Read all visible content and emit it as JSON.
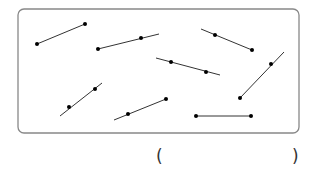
{
  "diagram": {
    "type": "line-segments-rays-lines",
    "frame": {
      "x": 18,
      "y": 9,
      "width": 281,
      "height": 124,
      "radius": 6,
      "stroke": "#888888"
    },
    "line_color": "#333333",
    "point_color": "#000000",
    "figures": [
      {
        "id": 1,
        "kind": "segment",
        "from": [
          37,
          44
        ],
        "to": [
          85,
          24
        ],
        "points": [
          [
            37,
            44
          ],
          [
            85,
            24
          ]
        ]
      },
      {
        "id": 2,
        "kind": "ray",
        "from": [
          98,
          49
        ],
        "to": [
          159,
          34
        ],
        "points": [
          [
            98,
            49
          ],
          [
            141,
            38
          ]
        ]
      },
      {
        "id": 3,
        "kind": "ray",
        "from": [
          201,
          29
        ],
        "to": [
          252,
          50
        ],
        "points": [
          [
            215,
            35
          ],
          [
            252,
            50
          ]
        ]
      },
      {
        "id": 4,
        "kind": "line",
        "from": [
          156,
          58
        ],
        "to": [
          220,
          75
        ],
        "points": [
          [
            171,
            62
          ],
          [
            206,
            72
          ]
        ]
      },
      {
        "id": 5,
        "kind": "ray",
        "from": [
          240,
          98
        ],
        "to": [
          284,
          52
        ],
        "points": [
          [
            240,
            98
          ],
          [
            271,
            64
          ]
        ]
      },
      {
        "id": 6,
        "kind": "line",
        "from": [
          60,
          116
        ],
        "to": [
          102,
          83
        ],
        "points": [
          [
            69,
            107
          ],
          [
            95,
            89
          ]
        ]
      },
      {
        "id": 7,
        "kind": "ray",
        "from": [
          114,
          120
        ],
        "to": [
          166,
          99
        ],
        "points": [
          [
            128,
            114
          ],
          [
            166,
            99
          ]
        ]
      },
      {
        "id": 8,
        "kind": "segment",
        "from": [
          196,
          116
        ],
        "to": [
          251,
          116
        ],
        "points": [
          [
            196,
            116
          ],
          [
            251,
            116
          ]
        ]
      }
    ]
  },
  "answer": {
    "open": "(",
    "close": ")",
    "value": ""
  }
}
